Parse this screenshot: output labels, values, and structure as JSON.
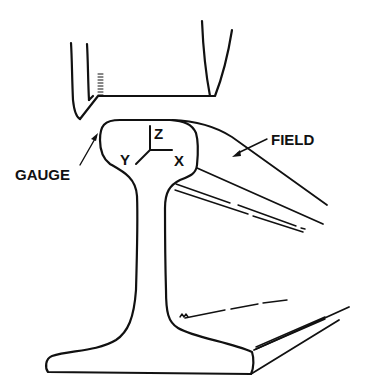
{
  "diagram": {
    "type": "technical-line-drawing",
    "colors": {
      "line": "#111111",
      "background": "#ffffff"
    },
    "labels": {
      "gauge": "GAUGE",
      "field": "FIELD",
      "axis_z": "Z",
      "axis_y": "Y",
      "axis_x": "X"
    }
  }
}
